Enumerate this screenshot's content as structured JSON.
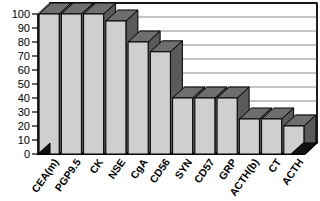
{
  "chart_data": {
    "type": "bar",
    "title": "",
    "subtitle": "",
    "xlabel": "",
    "ylabel": "",
    "ylim": [
      0,
      100
    ],
    "ytick_step": 10,
    "grid": true,
    "legend": false,
    "style": "3d-bar",
    "categories": [
      "CEA(m)",
      "PGP9.5",
      "CK",
      "NSE",
      "CgA",
      "CD56",
      "SYN",
      "CD57",
      "GRP",
      "ACTH(b)",
      "CT",
      "ACTH"
    ],
    "values": [
      100,
      100,
      100,
      95,
      80,
      73,
      40,
      40,
      40,
      25,
      25,
      20
    ],
    "ytick_labels": [
      "0",
      "10",
      "20",
      "30",
      "40",
      "50",
      "60",
      "70",
      "80",
      "90",
      "100"
    ],
    "colors": {
      "bar_face": "#cfcfcf",
      "bar_top": "#6e6e6e",
      "bar_side": "#5a5a5a",
      "grid": "#8a8a8a",
      "axis": "#000000",
      "background": "#ffffff"
    }
  }
}
